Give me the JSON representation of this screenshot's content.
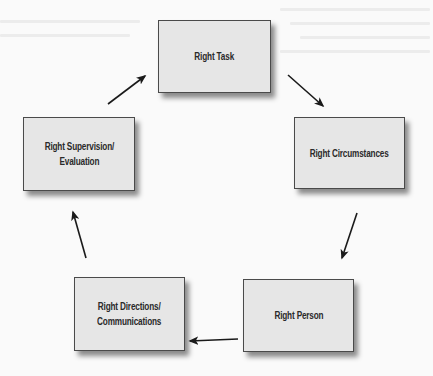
{
  "diagram": {
    "type": "cycle",
    "nodes": [
      {
        "id": "task",
        "label": "Right Task"
      },
      {
        "id": "circumstances",
        "label": "Right Circumstances"
      },
      {
        "id": "person",
        "label": "Right Person"
      },
      {
        "id": "directions",
        "label": "Right Directions/\nCommunications"
      },
      {
        "id": "supervision",
        "label": "Right Supervision/\nEvaluation"
      }
    ],
    "edges": [
      {
        "from": "task",
        "to": "circumstances"
      },
      {
        "from": "circumstances",
        "to": "person"
      },
      {
        "from": "person",
        "to": "directions"
      },
      {
        "from": "directions",
        "to": "supervision"
      },
      {
        "from": "supervision",
        "to": "task"
      }
    ],
    "colors": {
      "box_fill": "#e6e6e6",
      "box_border": "#4a4a4a",
      "arrow": "#1a1a1a",
      "background": "#fafafa"
    }
  }
}
